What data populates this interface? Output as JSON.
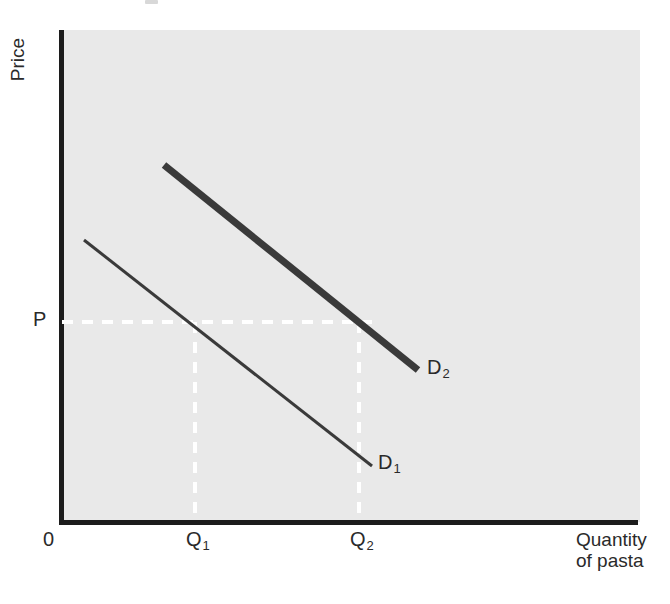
{
  "figure": {
    "kind": "economics-demand-shift-diagram",
    "background_color": "#ffffff",
    "panel_color": "#e9e9e9",
    "axis_color": "#1c1c1c",
    "curve_color": "#3a3a3a",
    "guide_color": "#ffffff"
  },
  "axes": {
    "y_title": "Price",
    "x_title_line1": "Quantity",
    "x_title_line2": "of pasta",
    "origin_label": "0"
  },
  "ticks": {
    "price": "P",
    "q1_letter": "Q",
    "q1_sub": "1",
    "q2_letter": "Q",
    "q2_sub": "2"
  },
  "curves": {
    "d1": {
      "letter": "D",
      "sub": "1",
      "label": "D1",
      "stroke_width": 3,
      "x1": 84,
      "y1": 240,
      "x2": 372,
      "y2": 466
    },
    "d2": {
      "letter": "D",
      "sub": "2",
      "label": "D2",
      "stroke_width": 7,
      "x1": 164,
      "y1": 165,
      "x2": 418,
      "y2": 370
    }
  },
  "guides": {
    "price_line_y": 322,
    "price_line_x_start": 62,
    "price_line_x_end": 372,
    "q1_x": 195,
    "q2_x": 359,
    "vline_y_start": 322,
    "vline_y_end": 522,
    "dash": "11 9"
  },
  "chart_data": {
    "type": "line",
    "title": "",
    "subtitle": "",
    "xlabel": "Quantity of pasta",
    "ylabel": "Price",
    "grid": false,
    "legend_position": "inline-end-of-curve",
    "axis_tick_labels": {
      "x": [
        "0",
        "Q1",
        "Q2"
      ],
      "y": [
        "P"
      ]
    },
    "xlim": [
      0,
      100
    ],
    "ylim": [
      0,
      100
    ],
    "series": [
      {
        "name": "D1",
        "style": "thin-solid-line",
        "description": "Original downward-sloping demand curve for pasta",
        "points": [
          {
            "x": 3.8,
            "y": 57.3
          },
          {
            "x": 53.6,
            "y": 11.4
          }
        ]
      },
      {
        "name": "D2",
        "style": "thick-solid-line",
        "description": "Shifted-right demand curve for pasta (increase in demand)",
        "points": [
          {
            "x": 17.6,
            "y": 72.6
          },
          {
            "x": 61.6,
            "y": 30.9
          }
        ]
      }
    ],
    "annotations": [
      {
        "text": "P",
        "type": "y-tick",
        "value": 40.7,
        "description": "Given price level"
      },
      {
        "text": "Q1",
        "type": "x-tick",
        "value": 23.0,
        "description": "Quantity demanded on D1 at price P"
      },
      {
        "text": "Q2",
        "type": "x-tick",
        "value": 51.4,
        "description": "Quantity demanded on D2 at price P"
      },
      {
        "text": "dashed guide from P across to D2 and down to Q1 and Q2",
        "type": "guide-lines"
      }
    ]
  }
}
